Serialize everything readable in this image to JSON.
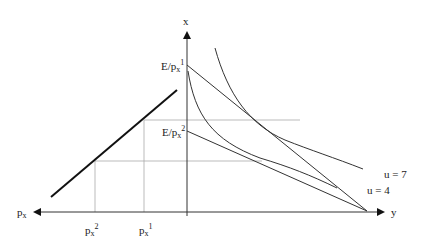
{
  "diagram": {
    "axes": {
      "vertical_label": "x",
      "right_label": "y",
      "left_label": "p",
      "left_label_sub": "x"
    },
    "intercepts": {
      "e1_main": "E/p",
      "e1_sub": "x",
      "e1_sup": "1",
      "e2_main": "E/p",
      "e2_sub": "x",
      "e2_sup": "2"
    },
    "price_ticks": {
      "p2_main": "p",
      "p2_sub": "x",
      "p2_sup": "2",
      "p1_main": "p",
      "p1_sub": "x",
      "p1_sup": "1"
    },
    "curves": {
      "u7_label": "u = 7",
      "u4_label": "u = 4"
    }
  }
}
